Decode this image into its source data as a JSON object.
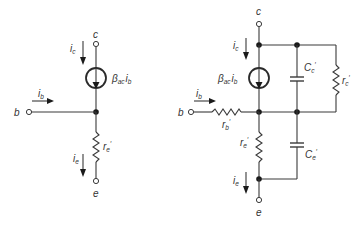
{
  "diagrams": [
    {
      "name": "simplified-r-parameter-model",
      "terminals": {
        "collector": "c",
        "base": "b",
        "emitter": "e"
      },
      "currents": {
        "ic": "i",
        "ic_sub": "c",
        "ib": "i",
        "ib_sub": "b",
        "ie": "i",
        "ie_sub": "e"
      },
      "source": {
        "beta": "β",
        "beta_sub": "ac",
        "i": "i",
        "i_sub": "b"
      },
      "resistor_re": {
        "r": "r",
        "sub": "e",
        "prime": "′"
      }
    },
    {
      "name": "full-r-parameter-model",
      "terminals": {
        "collector": "c",
        "base": "b",
        "emitter": "e"
      },
      "currents": {
        "ic": "i",
        "ic_sub": "c",
        "ib": "i",
        "ib_sub": "b",
        "ie": "i",
        "ie_sub": "e"
      },
      "source": {
        "beta": "β",
        "beta_sub": "ac",
        "i": "i",
        "i_sub": "b"
      },
      "resistor_rb": {
        "r": "r",
        "sub": "b",
        "prime": "′"
      },
      "resistor_re": {
        "r": "r",
        "sub": "e",
        "prime": "′"
      },
      "resistor_rc": {
        "r": "r",
        "sub": "c",
        "prime": "′"
      },
      "capacitor_cc": {
        "c": "C",
        "sub": "c",
        "prime": "′"
      },
      "capacitor_ce": {
        "c": "C",
        "sub": "e",
        "prime": "′"
      }
    }
  ],
  "colors": {
    "line": "#3a3a3a",
    "text": "#333333",
    "background": "#ffffff"
  }
}
